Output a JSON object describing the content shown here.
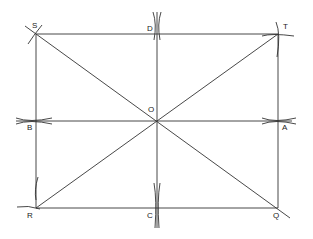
{
  "diagram": {
    "type": "geometric construction",
    "points": {
      "S": {
        "label": "S",
        "x": 36,
        "y": 34
      },
      "T": {
        "label": "T",
        "x": 278,
        "y": 34
      },
      "R": {
        "label": "R",
        "x": 36,
        "y": 208
      },
      "Q": {
        "label": "Q",
        "x": 278,
        "y": 208
      },
      "O": {
        "label": "O",
        "x": 157,
        "y": 121
      },
      "D": {
        "label": "D",
        "x": 157,
        "y": 34
      },
      "C": {
        "label": "C",
        "x": 157,
        "y": 208
      },
      "B": {
        "label": "B",
        "x": 36,
        "y": 121
      },
      "A": {
        "label": "A",
        "x": 278,
        "y": 121
      }
    },
    "segments": [
      "ST",
      "TQ",
      "QR",
      "RS",
      "SQ",
      "RT",
      "DC",
      "BA"
    ],
    "line_color": "#333333"
  }
}
